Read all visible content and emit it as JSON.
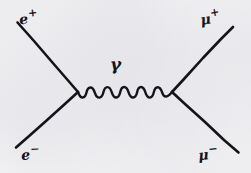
{
  "diagram": {
    "process": "e+ e- -> gamma -> mu+ mu-",
    "ink_color": "#14141a",
    "paper_color": "#f5f5f6",
    "style": "hand-drawn pen on paper",
    "vertices": [
      {
        "name": "left-vertex",
        "x": 78,
        "y": 92
      },
      {
        "name": "right-vertex",
        "x": 172,
        "y": 92
      }
    ],
    "propagator": {
      "name": "photon",
      "label": "γ",
      "label_x": 120,
      "label_y": 64,
      "kind": "wavy",
      "x_start": 78,
      "x_end": 172,
      "y": 92,
      "oscillations": 6,
      "amplitude": 6
    },
    "legs": [
      {
        "id": "e-plus",
        "label_base": "e",
        "label_charge": "+",
        "corner": "top-left",
        "x1": 17,
        "y1": 23,
        "x2": 78,
        "y2": 92
      },
      {
        "id": "e-minus",
        "label_base": "e",
        "label_charge": "−",
        "corner": "bottom-left",
        "x1": 78,
        "y1": 92,
        "x2": 16,
        "y2": 147
      },
      {
        "id": "mu-plus",
        "label_base": "μ",
        "label_charge": "+",
        "corner": "top-right",
        "x1": 172,
        "y1": 92,
        "x2": 233,
        "y2": 27
      },
      {
        "id": "mu-minus",
        "label_base": "μ",
        "label_charge": "−",
        "corner": "bottom-right",
        "x1": 172,
        "y1": 92,
        "x2": 238,
        "y2": 152
      }
    ]
  }
}
